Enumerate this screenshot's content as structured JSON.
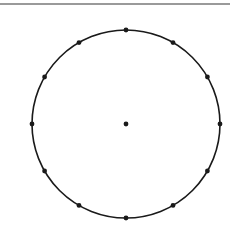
{
  "diagram": {
    "type": "circle-with-points",
    "top_rule_color": "#9a9a9a",
    "stroke_color": "#1a1a1a",
    "center": {
      "x": 126,
      "y": 124
    },
    "radius": 94,
    "circumference_point_count": 12,
    "angle_step_degrees": 30,
    "has_center_point": true,
    "point_radius": 2.4
  }
}
